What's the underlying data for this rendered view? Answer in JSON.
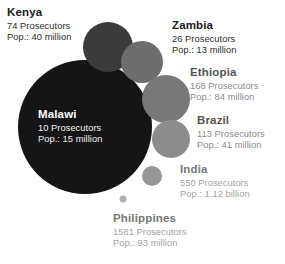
{
  "chart_data": {
    "type": "scatter",
    "title": "",
    "subtitle": "",
    "xlabel": "",
    "ylabel": "",
    "legend_position": "none",
    "grid": false,
    "encoding": "Bubble area encodes population served per prosecutor; larger bubble = fewer prosecutors per capita",
    "background_color": "#ffffff",
    "categories": [
      "Malawi",
      "Kenya",
      "Zambia",
      "Ethiopia",
      "Brazil",
      "India",
      "Philippines"
    ],
    "bubbles": [
      {
        "id": "malawi",
        "country": "Malawi",
        "prosecutors_label": "10 Prosecutors",
        "population_label": "Pop.: 15 million",
        "prosecutors": 10,
        "population": 15000000,
        "cx": 85,
        "cy": 127,
        "r": 67,
        "color": "#151515",
        "label_style": "inverse"
      },
      {
        "id": "kenya",
        "country": "Kenya",
        "prosecutors_label": "74 Prosecutors",
        "population_label": "Pop.: 40 million",
        "prosecutors": 74,
        "population": 40000000,
        "cx": 108,
        "cy": 47,
        "r": 25,
        "color": "#3b3b3b",
        "label_style": "dark"
      },
      {
        "id": "zambia",
        "country": "Zambia",
        "prosecutors_label": "26 Prosecutors",
        "population_label": "Pop.: 13 million",
        "prosecutors": 26,
        "population": 13000000,
        "cx": 142,
        "cy": 62,
        "r": 21,
        "color": "#6e6e6e",
        "label_style": "dark"
      },
      {
        "id": "ethiopia",
        "country": "Ethiopia",
        "prosecutors_label": "168 Prosecutors",
        "population_label": "Pop.: 84 million",
        "prosecutors": 168,
        "population": 84000000,
        "cx": 166,
        "cy": 99,
        "r": 24,
        "color": "#787878",
        "label_style": "mid"
      },
      {
        "id": "brazil",
        "country": "Brazil",
        "prosecutors_label": "113 Prosecutors",
        "population_label": "Pop.: 41 million",
        "prosecutors": 113,
        "population": 41000000,
        "cx": 171,
        "cy": 139,
        "r": 19,
        "color": "#8c8c8c",
        "label_style": "mid"
      },
      {
        "id": "india",
        "country": "India",
        "prosecutors_label": "550 Prosecutors",
        "population_label": "Pop.: 1.12 billion",
        "prosecutors": 550,
        "population": 1120000000,
        "cx": 152,
        "cy": 176,
        "r": 10,
        "color": "#979797",
        "label_style": "light"
      },
      {
        "id": "philippines",
        "country": "Philippines",
        "prosecutors_label": "1581 Prosecutors",
        "population_label": "Pop.: 93 million",
        "prosecutors": 1581,
        "population": 93000000,
        "cx": 123,
        "cy": 199,
        "r": 3.5,
        "color": "#b0b0b0",
        "label_style": "light"
      }
    ]
  },
  "labels": {
    "kenya": {
      "country": "Kenya",
      "prosecutors": "74 Prosecutors",
      "population": "Pop.: 40 million"
    },
    "zambia": {
      "country": "Zambia",
      "prosecutors": "26 Prosecutors",
      "population": "Pop.: 13 million"
    },
    "ethiopia": {
      "country": "Ethiopia",
      "prosecutors": "168 Prosecutors",
      "population": "Pop.: 84 million"
    },
    "brazil": {
      "country": "Brazil",
      "prosecutors": "113 Prosecutors",
      "population": "Pop.: 41 million"
    },
    "india": {
      "country": "India",
      "prosecutors": "550 Prosecutors",
      "population": "Pop.: 1.12 billion"
    },
    "philippines": {
      "country": "Philippines",
      "prosecutors": "1581 Prosecutors",
      "population": "Pop.: 93 million"
    },
    "malawi": {
      "country": "Malawi",
      "prosecutors": "10 Prosecutors",
      "population": "Pop.: 15 million"
    }
  }
}
